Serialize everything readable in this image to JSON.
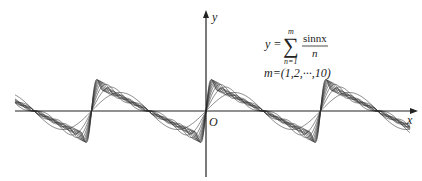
{
  "chart_data": {
    "type": "line",
    "title": "",
    "xlabel": "x",
    "ylabel": "y",
    "origin_label": "O",
    "function": "y = sum_{n=1}^{m} sin(n x) / n",
    "m_values": [
      1,
      2,
      3,
      4,
      5,
      6,
      7,
      8,
      9,
      10
    ],
    "x_range_data": [
      -10.5,
      11.2
    ],
    "y_range_data": [
      -2.2,
      2.2
    ],
    "series": [
      {
        "name": "m=1",
        "m": 1
      },
      {
        "name": "m=2",
        "m": 2
      },
      {
        "name": "m=3",
        "m": 3
      },
      {
        "name": "m=4",
        "m": 4
      },
      {
        "name": "m=5",
        "m": 5
      },
      {
        "name": "m=6",
        "m": 6
      },
      {
        "name": "m=7",
        "m": 7
      },
      {
        "name": "m=8",
        "m": 8
      },
      {
        "name": "m=9",
        "m": 9
      },
      {
        "name": "m=10",
        "m": 10
      }
    ],
    "grid": false,
    "legend": "none",
    "annotation": {
      "lhs": "y =",
      "sum_top": "m",
      "sum_bottom": "n=1",
      "numerator": "sinnx",
      "denominator": "n",
      "m_range": "m=(1,2,···,10)"
    }
  },
  "colors": {
    "axis": "#222222",
    "curve": "#333333"
  }
}
